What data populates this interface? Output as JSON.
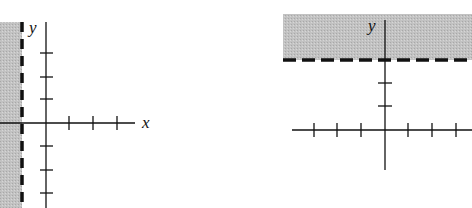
{
  "graphs": [
    {
      "id": "left",
      "description": "Inequality x < -1 shaded region with dashed boundary line x = -1",
      "x_axis_label": "x",
      "y_axis_label": "y",
      "boundary": "x = -1 (dashed)",
      "shaded_side": "left",
      "shade_color": "#bdbdbd"
    },
    {
      "id": "right",
      "description": "Inequality y > 3 shaded region with dashed boundary line y = 3",
      "x_axis_label": "",
      "y_axis_label": "y",
      "boundary": "y = 3 (dashed)",
      "shaded_side": "above",
      "shade_color": "#bdbdbd"
    }
  ],
  "colors": {
    "shade": "#bdbdbd",
    "line": "#111111",
    "background": "#ffffff"
  }
}
